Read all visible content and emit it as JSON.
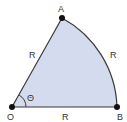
{
  "diagram": {
    "type": "circular-sector",
    "points": {
      "O": {
        "label": "O"
      },
      "A": {
        "label": "A"
      },
      "B": {
        "label": "B"
      }
    },
    "edges": {
      "OA": {
        "label": "R"
      },
      "OB": {
        "label": "R"
      },
      "arcAB": {
        "label": "R"
      }
    },
    "angle": {
      "label": "Θ"
    },
    "colors": {
      "fill": "#d5dbee",
      "stroke": "#3a3a3a",
      "point": "#111111"
    }
  }
}
